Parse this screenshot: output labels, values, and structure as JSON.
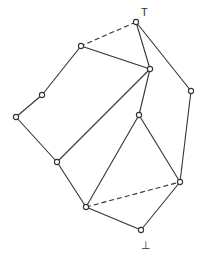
{
  "diagram": {
    "type": "lattice-hasse-diagram",
    "top_label": "T",
    "bottom_label": "⊥",
    "caption": "",
    "colors": {
      "stroke": "#333333",
      "background": "#ffffff"
    },
    "nodes": [
      {
        "id": "top",
        "x": 136,
        "y": 22
      },
      {
        "id": "a",
        "x": 81,
        "y": 46
      },
      {
        "id": "b",
        "x": 150,
        "y": 69
      },
      {
        "id": "c",
        "x": 191,
        "y": 91
      },
      {
        "id": "d",
        "x": 42,
        "y": 95
      },
      {
        "id": "f",
        "x": 139,
        "y": 115
      },
      {
        "id": "e",
        "x": 16,
        "y": 117
      },
      {
        "id": "g",
        "x": 57,
        "y": 162
      },
      {
        "id": "h",
        "x": 180,
        "y": 182
      },
      {
        "id": "i",
        "x": 86,
        "y": 207
      },
      {
        "id": "bottom",
        "x": 141,
        "y": 230
      }
    ],
    "edges": [
      {
        "from": "top",
        "to": "a",
        "style": "dashed"
      },
      {
        "from": "top",
        "to": "b",
        "style": "solid"
      },
      {
        "from": "top",
        "to": "c",
        "style": "solid"
      },
      {
        "from": "a",
        "to": "b",
        "style": "solid"
      },
      {
        "from": "a",
        "to": "d",
        "style": "solid"
      },
      {
        "from": "d",
        "to": "e",
        "style": "solid"
      },
      {
        "from": "e",
        "to": "g",
        "style": "solid"
      },
      {
        "from": "b",
        "to": "g",
        "style": "solid"
      },
      {
        "from": "b",
        "to": "f",
        "style": "solid"
      },
      {
        "from": "f",
        "to": "i",
        "style": "solid"
      },
      {
        "from": "f",
        "to": "h",
        "style": "solid"
      },
      {
        "from": "c",
        "to": "h",
        "style": "solid"
      },
      {
        "from": "g",
        "to": "i",
        "style": "solid"
      },
      {
        "from": "i",
        "to": "h",
        "style": "dashed"
      },
      {
        "from": "i",
        "to": "bottom",
        "style": "solid"
      },
      {
        "from": "bottom",
        "to": "h",
        "style": "solid"
      }
    ]
  }
}
